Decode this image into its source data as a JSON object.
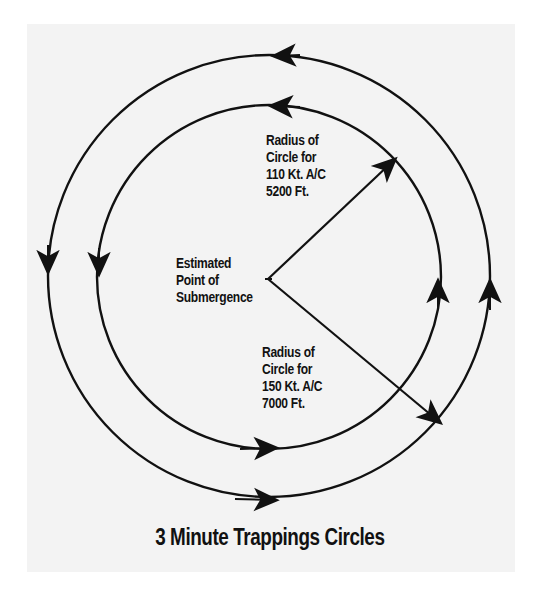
{
  "diagram": {
    "title": "3 Minute Trappings Circles",
    "center_label": {
      "lines": [
        "Estimated",
        "Point of",
        "Submergence"
      ]
    },
    "inner_radius_label": {
      "lines": [
        "Radius of",
        "Circle for",
        "110 Kt. A/C",
        "5200 Ft."
      ]
    },
    "outer_radius_label": {
      "lines": [
        "Radius of",
        "Circle for",
        "150 Kt. A/C",
        "7000 Ft."
      ]
    },
    "circles": [
      {
        "name": "inner",
        "speed": "110 Kt.",
        "radius_ft": "5200 Ft.",
        "direction": "counterclockwise"
      },
      {
        "name": "outer",
        "speed": "150 Kt.",
        "radius_ft": "7000 Ft.",
        "direction": "counterclockwise"
      }
    ],
    "colors": {
      "ink": "#111111",
      "panel": "#f3f3f3",
      "background": "#ffffff"
    }
  }
}
